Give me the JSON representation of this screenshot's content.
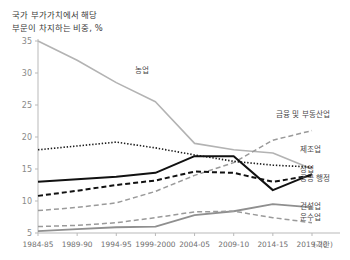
{
  "chart_data": {
    "type": "line",
    "title": "국가 부가가치에서 해당 부문이 차지하는 비중, %",
    "title_line1": "국가 부가가치에서 해당",
    "title_line2": "부문이 차지하는 비중, %",
    "xlabel": "(기간)",
    "ylabel": "",
    "categories": [
      "1984-85",
      "1989-90",
      "1994-95",
      "1999-2000",
      "2004-05",
      "2009-10",
      "2014-15",
      "2019-20"
    ],
    "yticks": [
      5,
      10,
      15,
      20,
      25,
      30,
      35
    ],
    "ylim": [
      5,
      35
    ],
    "grid": false,
    "legend": "inline-right",
    "series": [
      {
        "name": "농업",
        "values": [
          35.0,
          32.0,
          28.5,
          25.5,
          19.0,
          18.0,
          17.5,
          15.0
        ],
        "color": "#b3b3b3",
        "style": "solid",
        "width": 1.6,
        "label_x": 135,
        "label_y": 73
      },
      {
        "name": "금융 및 부동산업",
        "values": [
          8.5,
          9.0,
          9.7,
          11.5,
          14.0,
          16.0,
          19.5,
          21.0
        ],
        "color": "#9a9a9a",
        "style": "dashed",
        "width": 1.5,
        "label_x": 276,
        "label_y": 117
      },
      {
        "name": "제조업",
        "values": [
          18.0,
          18.6,
          19.2,
          18.3,
          17.2,
          16.2,
          15.6,
          15.3
        ],
        "color": "#1a1a1a",
        "style": "dotted",
        "width": 1.6,
        "label_x": 300,
        "label_y": 152
      },
      {
        "name": "상업",
        "values": [
          13.0,
          13.4,
          13.8,
          14.4,
          17.0,
          17.0,
          11.7,
          14.2
        ],
        "color": "#111111",
        "style": "solid",
        "width": 2.0,
        "label_x": 300,
        "label_y": 172
      },
      {
        "name": "공공 행정",
        "values": [
          10.8,
          11.6,
          12.5,
          13.2,
          14.6,
          14.4,
          13.0,
          14.0
        ],
        "color": "#111111",
        "style": "dashed",
        "width": 2.0,
        "label_x": 300,
        "label_y": 181
      },
      {
        "name": "건설업",
        "values": [
          5.3,
          5.6,
          5.9,
          6.0,
          7.8,
          8.4,
          9.5,
          9.0
        ],
        "color": "#8f8f8f",
        "style": "solid",
        "width": 1.8,
        "label_x": 300,
        "label_y": 209
      },
      {
        "name": "운수업",
        "values": [
          6.0,
          6.2,
          6.6,
          7.4,
          8.3,
          8.4,
          7.4,
          6.6
        ],
        "color": "#9a9a9a",
        "style": "dashed",
        "width": 1.5,
        "label_x": 300,
        "label_y": 220
      }
    ]
  },
  "axes": {
    "x_origin": 38,
    "x_end": 312,
    "y_top": 41,
    "y_bottom": 233
  }
}
